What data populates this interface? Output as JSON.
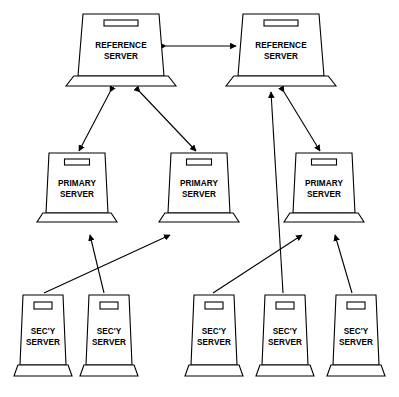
{
  "diagram": {
    "type": "network-hierarchy",
    "background_color": "#ffffff",
    "line_color": "#000000",
    "node_fill_color": "#ffffff",
    "tiers": [
      {
        "id": "reference",
        "label_line1": "REFERENCE",
        "label_line2": "SERVER",
        "count": 2
      },
      {
        "id": "primary",
        "label_line1": "PRIMARY",
        "label_line2": "SERVER",
        "count": 3
      },
      {
        "id": "secondary",
        "label_line1": "SEC'Y",
        "label_line2": "SERVER",
        "count": 5
      }
    ],
    "nodes": [
      {
        "id": "ref1",
        "tier": "reference",
        "line1": "REFERENCE",
        "line2": "SERVER",
        "x": 78,
        "y": 14,
        "w": 86,
        "h": 62,
        "size": "large"
      },
      {
        "id": "ref2",
        "tier": "reference",
        "line1": "REFERENCE",
        "line2": "SERVER",
        "x": 238,
        "y": 14,
        "w": 86,
        "h": 62,
        "size": "large"
      },
      {
        "id": "pri1",
        "tier": "primary",
        "line1": "PRIMARY",
        "line2": "SERVER",
        "x": 46,
        "y": 153,
        "w": 62,
        "h": 60,
        "size": "medium"
      },
      {
        "id": "pri2",
        "tier": "primary",
        "line1": "PRIMARY",
        "line2": "SERVER",
        "x": 168,
        "y": 153,
        "w": 62,
        "h": 60,
        "size": "medium"
      },
      {
        "id": "pri3",
        "tier": "primary",
        "line1": "PRIMARY",
        "line2": "SERVER",
        "x": 293,
        "y": 153,
        "w": 62,
        "h": 60,
        "size": "medium"
      },
      {
        "id": "sec1",
        "tier": "secondary",
        "line1": "SEC'Y",
        "line2": "SERVER",
        "x": 20,
        "y": 295,
        "w": 46,
        "h": 70,
        "size": "small"
      },
      {
        "id": "sec2",
        "tier": "secondary",
        "line1": "SEC'Y",
        "line2": "SERVER",
        "x": 86,
        "y": 295,
        "w": 46,
        "h": 70,
        "size": "small"
      },
      {
        "id": "sec3",
        "tier": "secondary",
        "line1": "SEC'Y",
        "line2": "SERVER",
        "x": 191,
        "y": 295,
        "w": 46,
        "h": 70,
        "size": "small"
      },
      {
        "id": "sec4",
        "tier": "secondary",
        "line1": "SEC'Y",
        "line2": "SERVER",
        "x": 262,
        "y": 295,
        "w": 46,
        "h": 70,
        "size": "small"
      },
      {
        "id": "sec5",
        "tier": "secondary",
        "line1": "SEC'Y",
        "line2": "SERVER",
        "x": 333,
        "y": 295,
        "w": 46,
        "h": 70,
        "size": "small"
      }
    ],
    "links": [
      {
        "id": "l-ref1-ref2",
        "from": "ref1",
        "to": "ref2",
        "arrows": "both",
        "x1": 166,
        "y1": 46,
        "x2": 236,
        "y2": 46
      },
      {
        "id": "l-ref1-pri1",
        "from": "ref1",
        "to": "pri1",
        "arrows": "both",
        "x1": 110,
        "y1": 92,
        "x2": 79,
        "y2": 151
      },
      {
        "id": "l-ref1-pri2",
        "from": "ref1",
        "to": "pri2",
        "arrows": "both",
        "x1": 140,
        "y1": 92,
        "x2": 196,
        "y2": 151
      },
      {
        "id": "l-ref2-pri3",
        "from": "ref2",
        "to": "pri3",
        "arrows": "both",
        "x1": 284,
        "y1": 92,
        "x2": 320,
        "y2": 151
      },
      {
        "id": "l-sec1-pri2",
        "from": "sec1",
        "to": "pri2",
        "arrows": "to",
        "x1": 44,
        "y1": 293,
        "x2": 170,
        "y2": 235
      },
      {
        "id": "l-sec2-pri1",
        "from": "sec2",
        "to": "pri1",
        "arrows": "to",
        "x1": 104,
        "y1": 293,
        "x2": 90,
        "y2": 235
      },
      {
        "id": "l-sec3-pri3",
        "from": "sec3",
        "to": "pri3",
        "arrows": "to",
        "x1": 213,
        "y1": 293,
        "x2": 302,
        "y2": 235
      },
      {
        "id": "l-sec4-ref2",
        "from": "sec4",
        "to": "ref2",
        "arrows": "to",
        "x1": 283,
        "y1": 293,
        "x2": 271,
        "y2": 92
      },
      {
        "id": "l-sec5-pri3",
        "from": "sec5",
        "to": "pri3",
        "arrows": "to",
        "x1": 352,
        "y1": 293,
        "x2": 335,
        "y2": 235
      }
    ]
  }
}
